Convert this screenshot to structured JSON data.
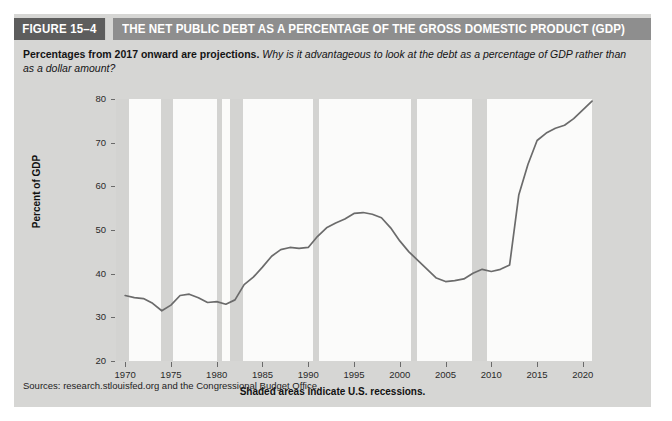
{
  "figure": {
    "number_label": "FIGURE 15–4",
    "title": "THE NET PUBLIC DEBT AS A PERCENTAGE OF THE GROSS DOMESTIC PRODUCT (GDP)",
    "caption_bold": "Percentages from 2017 onward are projections.",
    "caption_italic": "Why is it advantageous to look at the debt as a percentage of GDP rather than as a dollar amount?",
    "sources": "Sources: research.stlouisfed.org and the Congressional Budget Office.",
    "header_number_bg": "#5d5d5d",
    "header_title_bg": "#8e8e8e",
    "panel_bg": "#d6d6d4",
    "plot_bg": "#fbfbfa"
  },
  "chart_data": {
    "type": "line",
    "title": "THE NET PUBLIC DEBT AS A PERCENTAGE OF THE GROSS DOMESTIC PRODUCT (GDP)",
    "xlabel": "",
    "ylabel": "Percent of GDP",
    "xlim": [
      1969,
      2021
    ],
    "ylim": [
      20,
      80
    ],
    "yticks": [
      20,
      30,
      40,
      50,
      60,
      70,
      80
    ],
    "xticks": [
      1970,
      1975,
      1980,
      1985,
      1990,
      1995,
      2000,
      2005,
      2010,
      2015,
      2020
    ],
    "grid": false,
    "legend": "none",
    "line_color": "#6b6b6b",
    "annotation": "Shaded areas indicate U.S. recessions.",
    "recession_band_color": "#d3d3d1",
    "recession_bands": [
      {
        "label": "1969-1970 recession",
        "start": 1969.0,
        "end": 1970.4
      },
      {
        "label": "1973-1975 recession",
        "start": 1973.9,
        "end": 1975.2
      },
      {
        "label": "1980 recession",
        "start": 1980.0,
        "end": 1980.6
      },
      {
        "label": "1981-1982 recession",
        "start": 1981.5,
        "end": 1982.9
      },
      {
        "label": "1990-1991 recession",
        "start": 1990.5,
        "end": 1991.2
      },
      {
        "label": "2001 recession",
        "start": 2001.2,
        "end": 2001.9
      },
      {
        "label": "2007-2009 recession",
        "start": 2007.9,
        "end": 2009.5
      }
    ],
    "x": [
      1970,
      1971,
      1972,
      1973,
      1974,
      1975,
      1976,
      1977,
      1978,
      1979,
      1980,
      1981,
      1982,
      1983,
      1984,
      1985,
      1986,
      1987,
      1988,
      1989,
      1990,
      1991,
      1992,
      1993,
      1994,
      1995,
      1996,
      1997,
      1998,
      1999,
      2000,
      2001,
      2002,
      2003,
      2004,
      2005,
      2006,
      2007,
      2008,
      2009,
      2010,
      2011,
      2012,
      2013,
      2014,
      2015,
      2016,
      2017,
      2018,
      2019,
      2020,
      2021
    ],
    "values": [
      35.0,
      34.5,
      34.3,
      33.2,
      31.5,
      32.8,
      35.0,
      35.3,
      34.5,
      33.4,
      33.6,
      33.0,
      34.0,
      37.5,
      39.2,
      41.5,
      44.0,
      45.5,
      46.0,
      45.8,
      46.0,
      48.5,
      50.5,
      51.6,
      52.5,
      53.8,
      54.0,
      53.6,
      52.8,
      50.5,
      47.5,
      45.0,
      43.0,
      41.0,
      39.0,
      38.2,
      38.4,
      38.8,
      40.1,
      41.0,
      40.5,
      41.0,
      42.0,
      58.0,
      65.0,
      70.5,
      72.2,
      73.3,
      74.0,
      75.5,
      77.5,
      79.5
    ],
    "series_note": "Net public debt as a percentage of GDP; values from 2017 onward are projections."
  },
  "axis_text": {
    "y_title": "Percent of GDP",
    "y_labels": [
      "80",
      "70",
      "60",
      "50",
      "40",
      "30",
      "20"
    ],
    "x_labels": [
      "1970",
      "1975",
      "1980",
      "1985",
      "1990",
      "1995",
      "2000",
      "2005",
      "2010",
      "2015",
      "2020"
    ],
    "shaded_note": "Shaded areas indicate U.S. recessions."
  }
}
